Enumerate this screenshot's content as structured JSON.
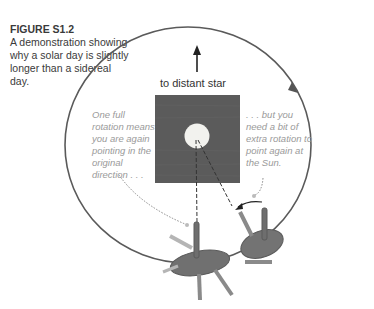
{
  "caption": {
    "figure_label": "FIGURE S1.2",
    "text": "A demonstration showing why a solar day is slightly longer than a sidereal day."
  },
  "diagram": {
    "star_direction_label": "to distant star",
    "note_left": "One full rotation means you are again pointing in the original direction . . .",
    "note_right": ". . . but you need a bit of extra rotation to point again at the Sun.",
    "colors": {
      "orbit": "#5a5a5a",
      "sun_square": "#5b5b5b",
      "sun": "#f2f2ee",
      "note_text": "#9a9a9a",
      "figure": "#6e6e6e"
    }
  }
}
